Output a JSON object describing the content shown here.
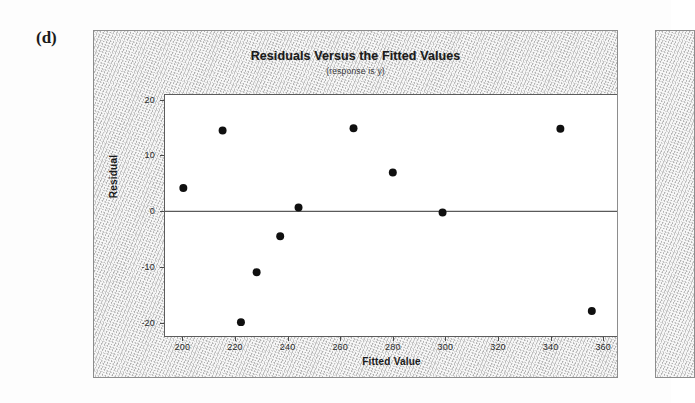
{
  "figure": {
    "label": "(d)"
  },
  "chart_data": {
    "type": "scatter",
    "title": "Residuals Versus the Fitted Values",
    "subtitle": "(response is y)",
    "xlabel": "Fitted Value",
    "ylabel": "Residual",
    "xlim": [
      193,
      366
    ],
    "ylim": [
      -22.5,
      21
    ],
    "xticks": [
      200,
      220,
      240,
      260,
      280,
      300,
      320,
      340,
      360
    ],
    "xticklabels": [
      "200",
      "220",
      "240",
      "260",
      "280",
      "300",
      "320",
      "340",
      "360"
    ],
    "yticks": [
      20,
      10,
      0,
      -10,
      -20
    ],
    "yticklabels": [
      "20",
      "10",
      "0",
      "-10",
      "-20"
    ],
    "grid": false,
    "legend": false,
    "reference_line": {
      "y": 0,
      "color": "#5a5a5a"
    },
    "marker": {
      "shape": "filled-circle",
      "color": "#101010",
      "size": 4
    },
    "x": [
      200,
      215,
      222,
      228,
      237,
      244,
      265,
      280,
      299,
      344,
      356
    ],
    "y": [
      4.2,
      14.6,
      -20.0,
      -11.0,
      -4.5,
      0.7,
      15.0,
      7.0,
      -0.2,
      14.9,
      -18.0
    ],
    "points": [
      {
        "x": 200,
        "y": 4.2
      },
      {
        "x": 215,
        "y": 14.6
      },
      {
        "x": 222,
        "y": -20.0
      },
      {
        "x": 228,
        "y": -11.0
      },
      {
        "x": 237,
        "y": -4.5
      },
      {
        "x": 244,
        "y": 0.7
      },
      {
        "x": 265,
        "y": 15.0
      },
      {
        "x": 280,
        "y": 7.0
      },
      {
        "x": 299,
        "y": -0.2
      },
      {
        "x": 344,
        "y": 14.9
      },
      {
        "x": 356,
        "y": -18.0
      }
    ]
  }
}
